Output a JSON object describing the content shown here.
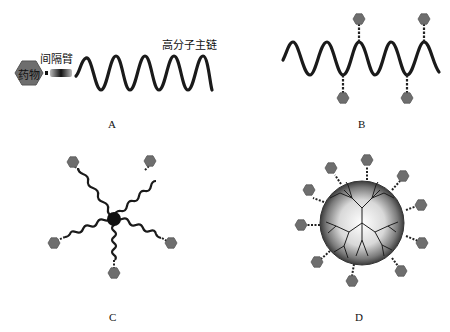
{
  "panels": {
    "A": {
      "caption": "A",
      "labels": {
        "drug": "药物",
        "spacer": "间隔臂",
        "backbone": "高分子主链"
      }
    },
    "B": {
      "caption": "B"
    },
    "C": {
      "caption": "C"
    },
    "D": {
      "caption": "D"
    }
  },
  "colors": {
    "chain": "#1a1a1a",
    "drug_hexagon": "#6b6b6b",
    "drug_hexagon_edge": "#555555",
    "spacer": "#222222",
    "core": "#111111"
  }
}
